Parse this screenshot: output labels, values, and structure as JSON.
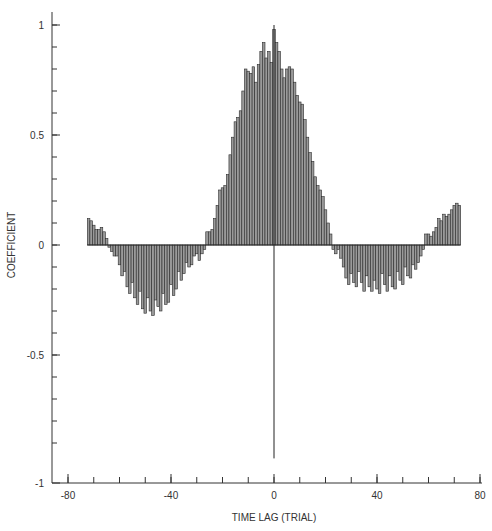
{
  "chart_data": {
    "type": "bar",
    "title": "",
    "xlabel": "TIME LAG (TRIAL)",
    "ylabel": "COEFFICIENT",
    "xlim": [
      -80,
      80
    ],
    "ylim": [
      -1,
      1
    ],
    "grid": false,
    "legend": null,
    "x_ticks_major": [
      -80,
      -40,
      0,
      40,
      80
    ],
    "x_ticks_minor_step": 10,
    "y_ticks_major": [
      -1,
      -0.5,
      0,
      0.5,
      1
    ],
    "y_tick_labels": [
      "-1",
      "-0.5",
      "0",
      "0.5",
      "1"
    ],
    "x_tick_labels": [
      "-80",
      "-40",
      "0",
      "40",
      "80"
    ],
    "y_ticks_minor_step": 0.1,
    "zero_lag_line": {
      "x": 0,
      "y_top": 1.0,
      "y_bottom": -0.97
    },
    "x": [
      -72,
      -71,
      -70,
      -69,
      -68,
      -67,
      -66,
      -65,
      -64,
      -63,
      -62,
      -61,
      -60,
      -59,
      -58,
      -57,
      -56,
      -55,
      -54,
      -53,
      -52,
      -51,
      -50,
      -49,
      -48,
      -47,
      -46,
      -45,
      -44,
      -43,
      -42,
      -41,
      -40,
      -39,
      -38,
      -37,
      -36,
      -35,
      -34,
      -33,
      -32,
      -31,
      -30,
      -29,
      -28,
      -27,
      -26,
      -25,
      -24,
      -23,
      -22,
      -21,
      -20,
      -19,
      -18,
      -17,
      -16,
      -15,
      -14,
      -13,
      -12,
      -11,
      -10,
      -9,
      -8,
      -7,
      -6,
      -5,
      -4,
      -3,
      -2,
      -1,
      0,
      1,
      2,
      3,
      4,
      5,
      6,
      7,
      8,
      9,
      10,
      11,
      12,
      13,
      14,
      15,
      16,
      17,
      18,
      19,
      20,
      21,
      22,
      23,
      24,
      25,
      26,
      27,
      28,
      29,
      30,
      31,
      32,
      33,
      34,
      35,
      36,
      37,
      38,
      39,
      40,
      41,
      42,
      43,
      44,
      45,
      46,
      47,
      48,
      49,
      50,
      51,
      52,
      53,
      54,
      55,
      56,
      57,
      58,
      59,
      60,
      61,
      62,
      63,
      64,
      65,
      66,
      67,
      68,
      69,
      70,
      71,
      72
    ],
    "values": [
      0.12,
      0.11,
      0.09,
      0.07,
      0.07,
      0.08,
      0.06,
      0.03,
      -0.01,
      -0.03,
      -0.05,
      -0.05,
      -0.09,
      -0.14,
      -0.12,
      -0.19,
      -0.22,
      -0.17,
      -0.24,
      -0.27,
      -0.21,
      -0.29,
      -0.31,
      -0.24,
      -0.3,
      -0.32,
      -0.25,
      -0.28,
      -0.3,
      -0.22,
      -0.27,
      -0.26,
      -0.18,
      -0.23,
      -0.2,
      -0.12,
      -0.16,
      -0.13,
      -0.08,
      -0.1,
      -0.09,
      -0.05,
      -0.04,
      -0.07,
      -0.04,
      -0.02,
      0.06,
      0.06,
      0.07,
      0.12,
      0.18,
      0.25,
      0.26,
      0.27,
      0.32,
      0.41,
      0.49,
      0.56,
      0.58,
      0.61,
      0.7,
      0.8,
      0.79,
      0.78,
      0.81,
      0.74,
      0.82,
      0.88,
      0.92,
      0.85,
      0.88,
      0.83,
      0.98,
      0.92,
      0.88,
      0.8,
      0.76,
      0.8,
      0.81,
      0.8,
      0.74,
      0.68,
      0.65,
      0.64,
      0.57,
      0.49,
      0.42,
      0.38,
      0.31,
      0.27,
      0.25,
      0.22,
      0.16,
      0.1,
      0.05,
      -0.02,
      -0.04,
      -0.02,
      -0.06,
      -0.1,
      -0.15,
      -0.18,
      -0.13,
      -0.17,
      -0.19,
      -0.12,
      -0.17,
      -0.21,
      -0.14,
      -0.19,
      -0.21,
      -0.16,
      -0.2,
      -0.22,
      -0.13,
      -0.18,
      -0.21,
      -0.14,
      -0.19,
      -0.2,
      -0.12,
      -0.16,
      -0.18,
      -0.1,
      -0.14,
      -0.15,
      -0.09,
      -0.11,
      -0.08,
      -0.05,
      -0.02,
      0.05,
      0.05,
      0.04,
      0.06,
      0.08,
      0.12,
      0.11,
      0.14,
      0.13,
      0.14,
      0.16,
      0.18,
      0.19,
      0.18
    ]
  },
  "axes": {
    "x_title": "TIME LAG (TRIAL)",
    "y_title": "COEFFICIENT"
  },
  "colors": {
    "bar_fill": "#9a9a9a",
    "bar_edge": "#2a2a2a",
    "axis": "#333333",
    "background": "#ffffff"
  }
}
